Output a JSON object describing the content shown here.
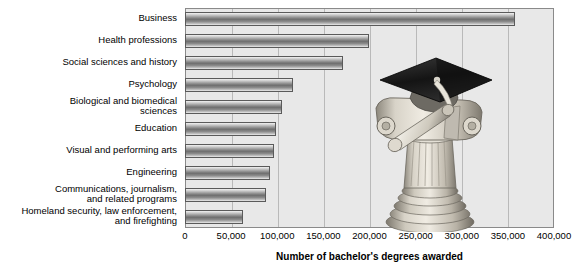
{
  "chart_data": {
    "type": "bar",
    "orientation": "horizontal",
    "title": "",
    "xlabel": "Number of bachelor's degrees awarded",
    "ylabel": "",
    "xlim": [
      0,
      400000
    ],
    "xticks": [
      0,
      50000,
      100000,
      150000,
      200000,
      250000,
      300000,
      350000,
      400000
    ],
    "xtick_labels": [
      "0",
      "50,000",
      "100,000",
      "150,000",
      "200,000",
      "250,000",
      "300,000",
      "350,000",
      "400,000"
    ],
    "grid": true,
    "legend": null,
    "categories": [
      "Business",
      "Health professions",
      "Social sciences and history",
      "Psychology",
      "Biological and biomedical\nsciences",
      "Education",
      "Visual and performing arts",
      "Engineering",
      "Communications, journalism,\nand related programs",
      "Homeland security, law enforcement,\nand firefighting"
    ],
    "values": [
      358000,
      199000,
      171000,
      117000,
      105000,
      99000,
      96000,
      92000,
      88000,
      63000
    ],
    "annotations": [
      "graduation-cap-on-column-illustration"
    ]
  },
  "colors": {
    "plot_background": "#e8e8e8",
    "plot_border": "#8a8a8a",
    "gridline": "#b9b9b9",
    "bar_dark": "#6e6e6e",
    "bar_light": "#f2f2f2",
    "bar_border": "#5a5a5a",
    "text": "#000000",
    "page_background": "#ffffff",
    "cap_black": "#1a1a1a",
    "column_stone": "#cfc9bd"
  },
  "artwork": {
    "name": "graduation-cap-and-diploma-on-ionic-column",
    "cap_label": "graduation-cap",
    "scroll_label": "diploma-scroll",
    "column_label": "ionic-column"
  }
}
